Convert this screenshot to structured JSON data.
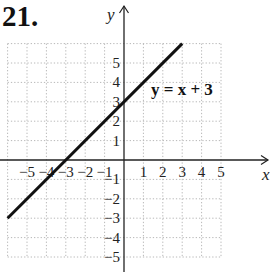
{
  "problem_number": "21.",
  "colors": {
    "grid": "#b8b8b8",
    "axis": "#222222",
    "line": "#111111"
  },
  "chart_data": {
    "type": "line",
    "title": "",
    "xlabel": "x",
    "ylabel": "y",
    "xlim": [
      -6,
      5
    ],
    "ylim": [
      -5,
      6
    ],
    "grid": true,
    "x_ticks": [
      -5,
      -4,
      -3,
      -2,
      -1,
      1,
      2,
      3,
      4,
      5
    ],
    "y_ticks": [
      5,
      4,
      3,
      2,
      1,
      -1,
      -2,
      -3,
      -4,
      -5
    ],
    "series": [
      {
        "name": "y = x + 3",
        "x": [
          -6,
          3
        ],
        "y": [
          -3,
          6
        ]
      }
    ],
    "annotations": [
      {
        "text": "y = x + 3",
        "x": 1.4,
        "y": 2.8
      }
    ]
  },
  "labels": {
    "x_axis": "x",
    "y_axis": "y",
    "equation": "y = x + 3",
    "x_ticks": [
      "−5",
      "−4",
      "−3",
      "−2",
      "−1",
      "1",
      "2",
      "3",
      "4",
      "5"
    ],
    "y_ticks": [
      "5",
      "4",
      "3",
      "2",
      "1",
      "−1",
      "−2",
      "−3",
      "−4",
      "−5"
    ]
  }
}
